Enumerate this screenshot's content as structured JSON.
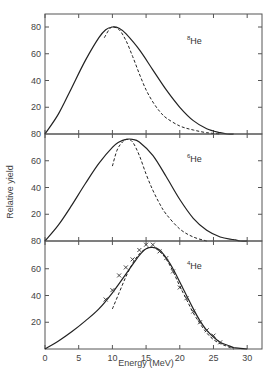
{
  "chart_data": [
    {
      "type": "line",
      "panel": "top",
      "label": "8He",
      "label_mass": "8",
      "label_element": "He",
      "xlabel": "Energy (MeV)",
      "ylabel": "Relative yield",
      "xlim": [
        0,
        32
      ],
      "ylim": [
        0,
        80
      ],
      "yticks": [
        20,
        40,
        60,
        80
      ],
      "ytick_labels": [
        "20",
        "40",
        "60",
        "80"
      ],
      "bottom_tick_label": "80",
      "series": [
        {
          "name": "solid",
          "style": "solid",
          "x": [
            0,
            2,
            4,
            6,
            8,
            9,
            10,
            11,
            12,
            14,
            16,
            18,
            20,
            22,
            24,
            26,
            27,
            28
          ],
          "y": [
            0,
            15,
            35,
            55,
            72,
            78,
            80,
            79,
            75,
            63,
            48,
            33,
            20,
            10,
            4,
            1,
            0,
            0
          ]
        },
        {
          "name": "dashed",
          "style": "dashed",
          "x": [
            8.8,
            9.5,
            10,
            11,
            12,
            13,
            14,
            15,
            16,
            17,
            18,
            20,
            22,
            24,
            26
          ],
          "y": [
            72,
            78,
            80,
            78,
            70,
            58,
            45,
            33,
            24,
            17,
            12,
            6,
            3,
            1,
            0
          ]
        }
      ]
    },
    {
      "type": "line",
      "panel": "middle",
      "label": "6He",
      "label_mass": "6",
      "label_element": "He",
      "xlim": [
        0,
        32
      ],
      "ylim": [
        0,
        80
      ],
      "yticks": [
        20,
        40,
        60,
        80
      ],
      "ytick_labels": [
        "20",
        "40",
        "60"
      ],
      "bottom_tick_label": "80",
      "series": [
        {
          "name": "solid",
          "style": "solid",
          "x": [
            0,
            2,
            4,
            6,
            8,
            10,
            11,
            12,
            13,
            14,
            16,
            18,
            20,
            22,
            24,
            26,
            28,
            29,
            30
          ],
          "y": [
            0,
            12,
            27,
            43,
            58,
            70,
            74,
            76,
            76,
            74,
            64,
            48,
            31,
            17,
            8,
            3,
            1,
            0,
            0
          ]
        },
        {
          "name": "dashed",
          "style": "dashed",
          "x": [
            10,
            10.7,
            11.5,
            12.2,
            13,
            14,
            15,
            16,
            17,
            18,
            20,
            22,
            24
          ],
          "y": [
            56,
            68,
            74,
            76,
            74,
            64,
            50,
            38,
            28,
            20,
            9,
            3,
            0
          ]
        }
      ]
    },
    {
      "type": "line",
      "panel": "bottom",
      "label": "4He",
      "label_mass": "4",
      "label_element": "He",
      "xlabel": "Energy (MeV)",
      "xlim": [
        0,
        32
      ],
      "ylim": [
        0,
        80
      ],
      "xticks": [
        0,
        5,
        10,
        15,
        20,
        25,
        30
      ],
      "xtick_labels": [
        "0",
        "5",
        "10",
        "15",
        "20",
        "25",
        "30"
      ],
      "yticks": [
        20,
        40,
        60,
        80
      ],
      "ytick_labels": [
        "20",
        "40",
        "60"
      ],
      "series": [
        {
          "name": "solid",
          "style": "solid",
          "x": [
            0,
            2,
            4,
            6,
            8,
            10,
            12,
            14,
            15,
            16,
            17,
            18,
            19,
            20,
            21,
            22,
            23,
            24,
            25,
            26,
            27,
            28,
            29,
            30
          ],
          "y": [
            0,
            6,
            13,
            21,
            30,
            42,
            56,
            70,
            75,
            76,
            74,
            68,
            60,
            50,
            40,
            30,
            21,
            14,
            9,
            5,
            3,
            1,
            0.5,
            0
          ]
        },
        {
          "name": "dashed",
          "style": "dashed",
          "x": [
            10,
            11,
            12,
            13,
            14,
            15,
            16,
            17,
            18,
            19,
            20,
            21,
            22,
            23,
            24,
            25,
            26,
            27,
            28
          ],
          "y": [
            30,
            42,
            54,
            64,
            71,
            75,
            76,
            73,
            67,
            58,
            47,
            37,
            27,
            19,
            12,
            7,
            4,
            2,
            0
          ]
        },
        {
          "name": "experimental",
          "style": "markers",
          "marker": "x",
          "x": [
            9,
            10,
            11,
            12,
            13,
            14,
            15,
            16,
            17,
            18,
            19,
            20,
            21,
            22,
            23,
            24,
            25,
            26
          ],
          "y": [
            37,
            44,
            55,
            61,
            67,
            74,
            78,
            78,
            73,
            68,
            58,
            46,
            38,
            28,
            20,
            14,
            10,
            5
          ]
        }
      ]
    }
  ],
  "axes": {
    "xlabel": "Energy (MeV)",
    "ylabel": "Relative yield"
  }
}
